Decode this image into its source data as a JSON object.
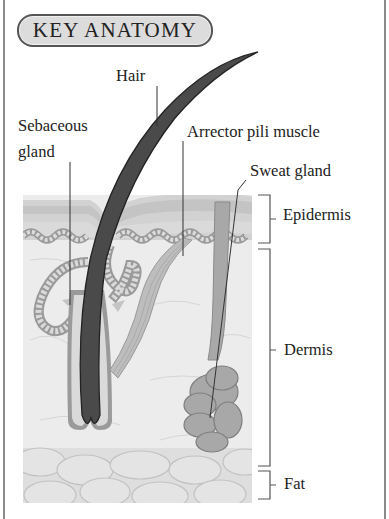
{
  "title": "KEY ANATOMY",
  "labels": {
    "hair": "Hair",
    "sebaceous_line1": "Sebaceous",
    "sebaceous_line2": "gland",
    "arrector": "Arrector pili muscle",
    "sweat": "Sweat gland",
    "epidermis": "Epidermis",
    "dermis": "Dermis",
    "fat": "Fat"
  },
  "colors": {
    "hair": "#4a4a4a",
    "epidermis": "#d2d2d2",
    "dermis": "#ececec",
    "fat": "#dcdcdc",
    "gland": "#a8a8a8",
    "frame": "#8a8a8a",
    "pill_bg": "#dcdcdc"
  }
}
